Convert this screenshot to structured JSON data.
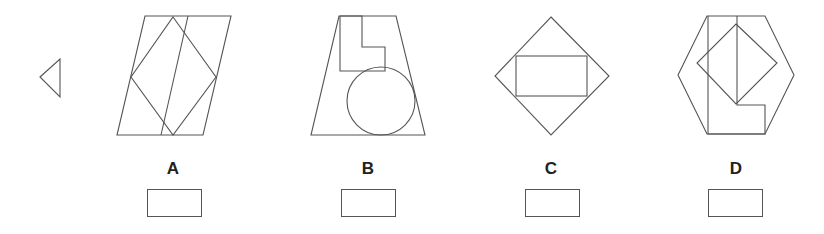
{
  "question": {
    "given_shape": "left-pointing-triangle"
  },
  "options": [
    {
      "label": "A",
      "description": "parallelogram with inscribed diamond and a slanted line",
      "answer": ""
    },
    {
      "label": "B",
      "description": "trapezoid with L-shape and circle",
      "answer": ""
    },
    {
      "label": "C",
      "description": "diamond with inscribed rectangle",
      "answer": ""
    },
    {
      "label": "D",
      "description": "hexagon with diamond and L-shape",
      "answer": ""
    }
  ],
  "colors": {
    "stroke": "#555555",
    "background": "#ffffff"
  }
}
